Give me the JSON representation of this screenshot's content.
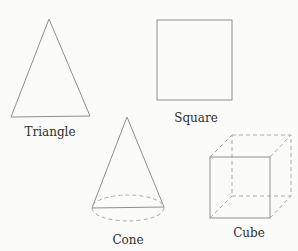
{
  "diagram": {
    "shapes": [
      {
        "id": "triangle",
        "label": "Triangle",
        "kind": "2d"
      },
      {
        "id": "square",
        "label": "Square",
        "kind": "2d"
      },
      {
        "id": "cone",
        "label": "Cone",
        "kind": "3d"
      },
      {
        "id": "cube",
        "label": "Cube",
        "kind": "3d"
      }
    ],
    "colors": {
      "background": "#fbfbfa",
      "line": "#8f8f8f",
      "hidden_line": "#a8a8a8",
      "text": "#2e2e2e"
    }
  }
}
